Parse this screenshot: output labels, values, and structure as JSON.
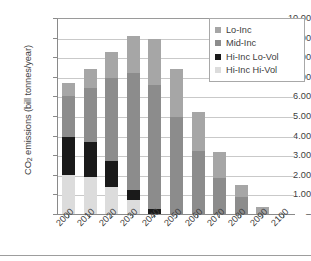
{
  "chart_data": {
    "type": "bar",
    "stacked": true,
    "title": "",
    "xlabel": "",
    "ylabel": "CO2 emissions (bill tonnes/year)",
    "ylim": [
      0,
      10
    ],
    "ytick_step": 1,
    "grid": true,
    "legend_position": "top-right",
    "categories": [
      "2000",
      "2010",
      "2020",
      "2030",
      "2040",
      "2050",
      "2060",
      "2070",
      "2080",
      "2090",
      "2100"
    ],
    "ytick_labels": [
      "10.00",
      "9.00",
      "8.00",
      "7.00",
      "6.00",
      "5.00",
      "4.00",
      "3.00",
      "2.00",
      "1.00",
      "–"
    ],
    "ytick_values": [
      10,
      9,
      8,
      7,
      6,
      5,
      4,
      3,
      2,
      1,
      0
    ],
    "series": [
      {
        "name": "Hi-Inc Hi-Vol",
        "color": "#dcdcdc",
        "values": [
          2.0,
          1.88,
          1.4,
          0.72,
          0.0,
          0.0,
          0.0,
          0.0,
          0.0,
          0.0,
          0.0
        ]
      },
      {
        "name": "Hi-Inc Lo-Vol",
        "color": "#1a1a1a",
        "values": [
          1.95,
          1.77,
          1.28,
          0.53,
          0.25,
          0.0,
          0.0,
          0.0,
          0.0,
          0.0,
          0.0
        ]
      },
      {
        "name": "Mid-Inc",
        "color": "#8c8c8c",
        "values": [
          2.05,
          2.8,
          4.25,
          5.97,
          6.35,
          4.95,
          3.22,
          1.83,
          0.85,
          0.0,
          0.0
        ]
      },
      {
        "name": "Lo-Inc",
        "color": "#a6a6a6",
        "values": [
          0.7,
          0.93,
          1.34,
          1.86,
          2.33,
          2.46,
          2.01,
          1.32,
          0.63,
          0.38,
          0.0
        ]
      }
    ],
    "stack_order_bottom_to_top": [
      "Hi-Inc Hi-Vol",
      "Hi-Inc Lo-Vol",
      "Mid-Inc",
      "Lo-Inc"
    ],
    "totals": [
      6.7,
      7.38,
      8.27,
      9.08,
      8.93,
      7.41,
      5.23,
      3.15,
      1.48,
      0.38,
      0.0
    ]
  },
  "legend": {
    "entries": [
      {
        "label": "Lo-Inc",
        "color": "#a6a6a6"
      },
      {
        "label": "Mid-Inc",
        "color": "#8c8c8c"
      },
      {
        "label": "Hi-Inc Lo-Vol",
        "color": "#1a1a1a"
      },
      {
        "label": "Hi-Inc Hi-Vol",
        "color": "#dcdcdc"
      }
    ]
  },
  "axis": {
    "y_title_prefix": "CO",
    "y_title_sub": "2",
    "y_title_suffix": " emissions (bill tonnes/year)"
  }
}
